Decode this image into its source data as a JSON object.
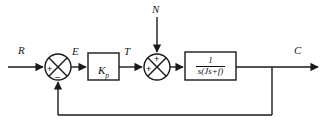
{
  "diagram": {
    "type": "control-block-diagram",
    "background_color": "#ffffff",
    "line_color": "#1a1a1a",
    "signals": {
      "reference_input": "R",
      "error": "E",
      "torque": "T",
      "disturbance": "N",
      "output": "C"
    },
    "blocks": [
      {
        "name": "proportional-gain",
        "label": "K",
        "subscript": "p",
        "x": 88,
        "y": 53,
        "w": 31,
        "h": 27
      },
      {
        "name": "plant-transfer-function",
        "numerator": "1",
        "denominator": "s(Js+f)",
        "x": 185,
        "y": 52,
        "w": 51,
        "h": 28
      }
    ],
    "summing_junctions": [
      {
        "name": "error-summing-junction",
        "cx": 58,
        "cy": 67,
        "r": 13,
        "input_sign_left": "+",
        "input_sign_bottom": "–"
      },
      {
        "name": "disturbance-summing-junction",
        "cx": 157,
        "cy": 67,
        "r": 13,
        "input_sign_left": "+",
        "input_sign_top": "+"
      }
    ],
    "feedback": {
      "name": "unity-feedback-path",
      "tap_x": 272,
      "bottom_y": 115,
      "return_x": 58
    }
  }
}
